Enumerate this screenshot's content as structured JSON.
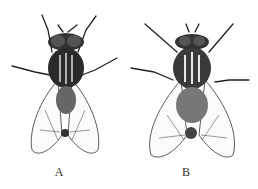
{
  "figures": [
    {
      "label": "A",
      "subject": "fly-dorsal-view"
    },
    {
      "label": "B",
      "subject": "fly-dorsal-view"
    }
  ]
}
